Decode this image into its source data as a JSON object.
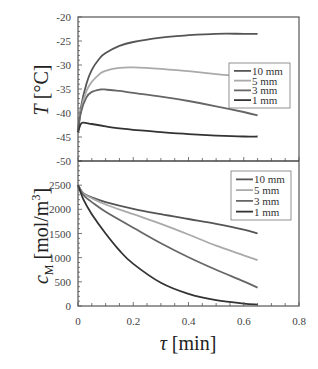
{
  "chart_data": [
    {
      "type": "line",
      "panel": "upper",
      "title": "",
      "xlabel": "τ [min]",
      "ylabel": "T [°C]",
      "ylabel_parts": {
        "symbol": "T",
        "unit": " [°C]"
      },
      "xlim": [
        0,
        0.8
      ],
      "ylim": [
        -50,
        -20
      ],
      "yticks": [
        -20,
        -25,
        -30,
        -35,
        -40,
        -45,
        -50
      ],
      "legend_position": "right-middle",
      "legend": [
        "10 mm",
        "5 mm",
        "3 mm",
        "1 mm"
      ],
      "series": [
        {
          "name": "10 mm",
          "color": "#555555",
          "x": [
            0,
            0.01,
            0.03,
            0.05,
            0.08,
            0.1,
            0.15,
            0.2,
            0.3,
            0.4,
            0.5,
            0.6,
            0.65
          ],
          "y": [
            -44,
            -39,
            -34,
            -31,
            -28.5,
            -27.5,
            -26,
            -25.2,
            -24.3,
            -23.8,
            -23.5,
            -23.5,
            -23.5
          ]
        },
        {
          "name": "5 mm",
          "color": "#aaaaaa",
          "x": [
            0,
            0.01,
            0.03,
            0.05,
            0.08,
            0.1,
            0.15,
            0.2,
            0.3,
            0.4,
            0.5,
            0.6,
            0.65
          ],
          "y": [
            -44,
            -39.5,
            -35.5,
            -33.5,
            -31.8,
            -31.2,
            -30.6,
            -30.5,
            -30.8,
            -31.3,
            -31.9,
            -32.4,
            -32.6
          ]
        },
        {
          "name": "3 mm",
          "color": "#666666",
          "x": [
            0,
            0.01,
            0.03,
            0.05,
            0.08,
            0.1,
            0.15,
            0.2,
            0.3,
            0.4,
            0.5,
            0.6,
            0.65
          ],
          "y": [
            -44,
            -40,
            -36.8,
            -35.6,
            -35.1,
            -35.1,
            -35.4,
            -35.8,
            -36.6,
            -37.5,
            -38.6,
            -39.8,
            -40.5
          ]
        },
        {
          "name": "1 mm",
          "color": "#333333",
          "x": [
            0,
            0.01,
            0.02,
            0.05,
            0.1,
            0.15,
            0.2,
            0.3,
            0.4,
            0.5,
            0.6,
            0.65
          ],
          "y": [
            -44,
            -42.3,
            -42,
            -42.3,
            -42.8,
            -43.2,
            -43.5,
            -44,
            -44.4,
            -44.7,
            -44.9,
            -44.9
          ]
        }
      ]
    },
    {
      "type": "line",
      "panel": "lower",
      "title": "",
      "xlabel": "τ [min]",
      "ylabel": "c_M [mol/m³]",
      "ylabel_parts": {
        "symbol": "c",
        "subscript": "M",
        "unit": " [mol/m",
        "sup": "3",
        "close": "]"
      },
      "xlim": [
        0,
        0.8
      ],
      "ylim": [
        0,
        3000
      ],
      "yticks": [
        0,
        500,
        1000,
        1500,
        2000,
        2500
      ],
      "xticks": [
        0,
        0.2,
        0.4,
        0.6,
        0.8
      ],
      "legend_position": "upper-right",
      "legend": [
        "10 mm",
        "5 mm",
        "3 mm",
        "1 mm"
      ],
      "series": [
        {
          "name": "10 mm",
          "color": "#555555",
          "x": [
            0,
            0.02,
            0.05,
            0.1,
            0.2,
            0.3,
            0.4,
            0.5,
            0.6,
            0.65
          ],
          "y": [
            2500,
            2330,
            2250,
            2150,
            2010,
            1900,
            1800,
            1700,
            1580,
            1500
          ]
        },
        {
          "name": "5 mm",
          "color": "#aaaaaa",
          "x": [
            0,
            0.02,
            0.05,
            0.1,
            0.2,
            0.3,
            0.4,
            0.5,
            0.6,
            0.65
          ],
          "y": [
            2500,
            2320,
            2230,
            2100,
            1900,
            1700,
            1480,
            1250,
            1050,
            950
          ]
        },
        {
          "name": "3 mm",
          "color": "#666666",
          "x": [
            0,
            0.02,
            0.05,
            0.1,
            0.2,
            0.3,
            0.4,
            0.5,
            0.6,
            0.65
          ],
          "y": [
            2500,
            2290,
            2150,
            1950,
            1620,
            1300,
            1010,
            750,
            510,
            380
          ]
        },
        {
          "name": "1 mm",
          "color": "#333333",
          "x": [
            0,
            0.02,
            0.05,
            0.1,
            0.15,
            0.2,
            0.3,
            0.4,
            0.5,
            0.6,
            0.65
          ],
          "y": [
            2500,
            2200,
            1900,
            1500,
            1150,
            870,
            480,
            250,
            120,
            50,
            30
          ]
        }
      ]
    }
  ],
  "layout": {
    "plot_left": 78,
    "plot_right": 299,
    "upper_top": 17,
    "divider": 161,
    "lower_bottom": 306,
    "axis_color": "#555555",
    "legend_upper": {
      "x": 229,
      "y": 63,
      "w": 61,
      "h": 45
    },
    "legend_lower": {
      "x": 231,
      "y": 171,
      "w": 60,
      "h": 49
    }
  }
}
